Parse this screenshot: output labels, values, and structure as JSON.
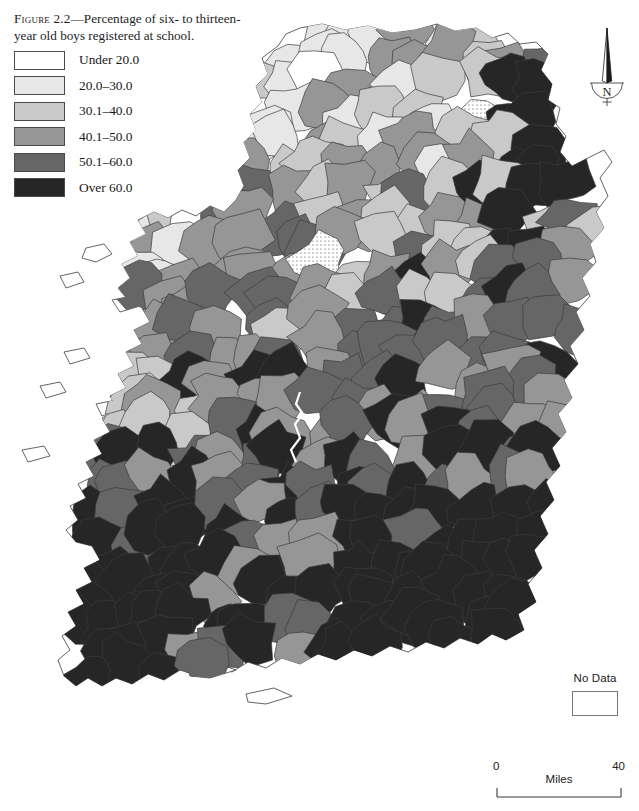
{
  "caption": {
    "figure_label": "Figure 2.2",
    "text": "—Percentage of six- to thirteen-year old boys registered at school."
  },
  "legend": {
    "classes": [
      {
        "label": "Under 20.0",
        "color": "#ffffff"
      },
      {
        "label": "20.0–30.0",
        "color": "#e7e7e7"
      },
      {
        "label": "30.1–40.0",
        "color": "#c9c9c9"
      },
      {
        "label": "40.1–50.0",
        "color": "#969696"
      },
      {
        "label": "50.1–60.0",
        "color": "#666666"
      },
      {
        "label": "Over 60.0",
        "color": "#262626"
      }
    ]
  },
  "no_data_key": {
    "label": "No Data"
  },
  "north_arrow": {
    "label": "N"
  },
  "scale_bar": {
    "min": "0",
    "max": "40",
    "unit": "Miles"
  },
  "chart_data": {
    "type": "choropleth-map",
    "title": "Percentage of six- to thirteen-year old boys registered at school",
    "region": "Ireland",
    "unit_of_enumeration": "district",
    "value_unit": "percent",
    "class_breaks": [
      {
        "label": "Under 20.0",
        "min": 0,
        "max": 20.0,
        "color": "#ffffff"
      },
      {
        "label": "20.0–30.0",
        "min": 20.0,
        "max": 30.0,
        "color": "#e7e7e7"
      },
      {
        "label": "30.1–40.0",
        "min": 30.1,
        "max": 40.0,
        "color": "#c9c9c9"
      },
      {
        "label": "40.1–50.0",
        "min": 40.1,
        "max": 50.0,
        "color": "#969696"
      },
      {
        "label": "50.1–60.0",
        "min": 50.1,
        "max": 60.0,
        "color": "#666666"
      },
      {
        "label": "Over 60.0",
        "min": 60.0,
        "max": 100,
        "color": "#262626"
      }
    ],
    "no_data": {
      "label": "No Data",
      "fill": "stipple"
    },
    "legend_position": "top-left",
    "scale": {
      "min": 0,
      "max": 40,
      "unit": "Miles"
    },
    "north_arrow": true,
    "regional_summary": [
      {
        "region": "Ulster (north)",
        "dominant_class": "20.0–30.0"
      },
      {
        "region": "North-east (Antrim/Down)",
        "dominant_class": "Over 60.0"
      },
      {
        "region": "Connacht (west)",
        "dominant_class": "30.1–40.0"
      },
      {
        "region": "Midlands",
        "dominant_class": "30.1–40.0"
      },
      {
        "region": "East (Dublin region)",
        "dominant_class": "40.1–50.0"
      },
      {
        "region": "South-west (Kerry/Cork)",
        "dominant_class": "Over 60.0"
      },
      {
        "region": "South-east",
        "dominant_class": "50.1–60.0"
      }
    ]
  }
}
